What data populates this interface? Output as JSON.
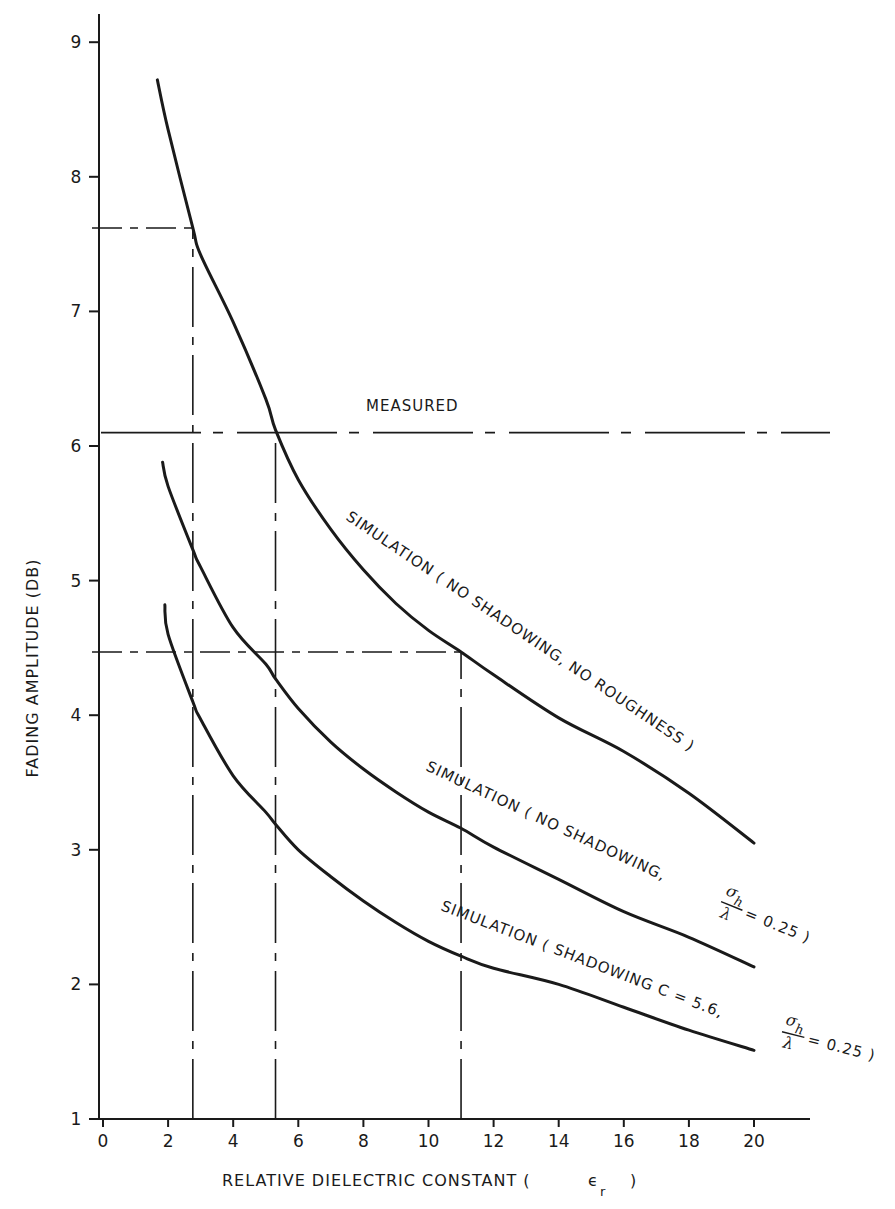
{
  "chart_data": {
    "type": "line",
    "title": "",
    "xlabel": "RELATIVE DIELECTRIC CONSTANT (ϵ r )",
    "ylabel": "FADING AMPLITUDE (DB)",
    "xlim": [
      0,
      22
    ],
    "ylim": [
      1,
      9.2
    ],
    "x_ticks": [
      0,
      2,
      4,
      6,
      8,
      10,
      12,
      14,
      16,
      18,
      20
    ],
    "x_tick_labels": [
      "0",
      "2",
      "4",
      "6",
      "8",
      "10",
      "12",
      "14",
      "16",
      "18",
      "20"
    ],
    "y_ticks": [
      1,
      2,
      3,
      4,
      5,
      6,
      7,
      8,
      9
    ],
    "y_tick_labels": [
      "1",
      "2",
      "3",
      "4",
      "5",
      "6",
      "7",
      "8",
      "9"
    ],
    "grid": false,
    "legend": "inline labels along curves",
    "series": [
      {
        "name": "SIMULATION ( NO SHADOWING, NO ROUGHNESS )",
        "style": "solid",
        "x": [
          1.67,
          2,
          2.76,
          3,
          4,
          5,
          5.3,
          6,
          7,
          8,
          9,
          10,
          11,
          12,
          14,
          16,
          18,
          20
        ],
        "y": [
          8.72,
          8.35,
          7.62,
          7.42,
          6.92,
          6.35,
          6.12,
          5.75,
          5.38,
          5.08,
          4.83,
          4.63,
          4.47,
          4.3,
          3.98,
          3.73,
          3.42,
          3.05
        ]
      },
      {
        "name": "SIMULATION ( NO SHADOWING, σh/λ = 0.25 )",
        "style": "solid",
        "x": [
          1.83,
          2,
          2.76,
          3,
          4,
          5,
          5.3,
          6,
          7,
          8,
          9,
          10,
          11,
          12,
          14,
          16,
          18,
          20
        ],
        "y": [
          5.88,
          5.7,
          5.23,
          5.1,
          4.65,
          4.38,
          4.27,
          4.05,
          3.8,
          3.6,
          3.43,
          3.28,
          3.16,
          3.02,
          2.78,
          2.54,
          2.35,
          2.13
        ]
      },
      {
        "name": "SIMULATION ( SHADOWING C = 5.6, σh/λ = 0.25 )",
        "style": "solid",
        "x": [
          1.9,
          2,
          2.76,
          3,
          4,
          5,
          5.3,
          6,
          7,
          8,
          9,
          10,
          11,
          12,
          14,
          16,
          18,
          20
        ],
        "y": [
          4.82,
          4.6,
          4.1,
          3.97,
          3.55,
          3.28,
          3.19,
          3.0,
          2.8,
          2.62,
          2.46,
          2.32,
          2.21,
          2.12,
          2.0,
          1.83,
          1.66,
          1.51
        ]
      },
      {
        "name": "MEASURED",
        "style": "dash-dot horizontal",
        "x": [
          0,
          22
        ],
        "y": [
          6.1,
          6.1
        ]
      }
    ],
    "reference_lines": [
      {
        "type": "horizontal",
        "style": "dashed",
        "y": 7.62,
        "x_from": 0,
        "x_to": 2.76
      },
      {
        "type": "vertical",
        "style": "dash-dot",
        "x": 2.76,
        "y_from": 1,
        "y_to": 7.62
      },
      {
        "type": "vertical",
        "style": "dash-dot",
        "x": 5.3,
        "y_from": 1,
        "y_to": 6.1
      },
      {
        "type": "horizontal",
        "style": "dashed",
        "y": 4.47,
        "x_from": 0,
        "x_to": 11
      },
      {
        "type": "vertical",
        "style": "dash-dot",
        "x": 11,
        "y_from": 1,
        "y_to": 4.47
      }
    ],
    "annotations": [
      {
        "text": "MEASURED",
        "x": 8,
        "y": 6.3
      },
      {
        "text": "SIMULATION ( NO SHADOWING, NO ROUGHNESS )"
      },
      {
        "text": "SIMULATION ( NO SHADOWING, σh/λ = 0.25 )"
      },
      {
        "text": "SIMULATION ( SHADOWING C = 5.6, σh/λ = 0.25 )"
      }
    ]
  },
  "labels": {
    "xlabel_main": "RELATIVE DIELECTRIC CONSTANT (",
    "xlabel_eps": "ϵ",
    "xlabel_sub": "r",
    "xlabel_close": ")",
    "ylabel": "FADING AMPLITUDE (DB)",
    "measured": "MEASURED",
    "curve1": "SIMULATION ( NO SHADOWING, NO ROUGHNESS )",
    "curve2_main": "SIMULATION ( NO SHADOWING,",
    "curve2_tail": "= 0.25 )",
    "curve3_main": "SIMULATION ( SHADOWING C = 5.6,",
    "curve3_tail": "= 0.25 )",
    "frac_num": "σ",
    "frac_num_sub": "h",
    "frac_den": "λ"
  }
}
